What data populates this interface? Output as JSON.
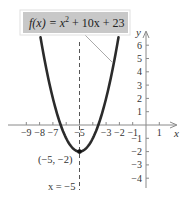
{
  "chart_data": {
    "type": "line",
    "title": "",
    "function_label": "f(x) = x² + 10x + 23",
    "function_label_parts": {
      "lhs": "f(x) = x",
      "exp": "2",
      "rhs": " + 10x + 23"
    },
    "xlabel": "x",
    "ylabel": "y",
    "xlim": [
      -10,
      2.5
    ],
    "ylim": [
      -5,
      6.5
    ],
    "x_ticks": [
      -9,
      -8,
      -7,
      -6,
      -5,
      -4,
      -3,
      -2,
      -1,
      1
    ],
    "x_tick_labels": [
      "−9",
      "−8",
      "−7",
      "−5",
      "−3",
      "−2",
      "−1",
      "1"
    ],
    "x_tick_label_values": [
      -9,
      -8,
      -7,
      -5,
      -3,
      -2,
      -1,
      1
    ],
    "y_ticks": [
      -4,
      -3,
      -2,
      -1,
      1,
      2,
      3,
      4,
      5,
      6
    ],
    "y_tick_labels": [
      "6",
      "5",
      "4",
      "3",
      "2",
      "1",
      "−1",
      "−2",
      "−3",
      "−4"
    ],
    "y_tick_label_values": [
      6,
      5,
      4,
      3,
      2,
      1,
      -1,
      -2,
      -3,
      -4
    ],
    "series": [
      {
        "name": "f(x) = x^2 + 10x + 23",
        "coefficients": {
          "a": 1,
          "b": 10,
          "c": 23
        },
        "x": [
          -7.9,
          -7.5,
          -7,
          -6.5,
          -6,
          -5.5,
          -5,
          -4.5,
          -4,
          -3.5,
          -3,
          -2.5,
          -2.1
        ],
        "values": [
          6.41,
          4.25,
          2,
          0.25,
          -1,
          -1.75,
          -2,
          -1.75,
          -1,
          0.25,
          2,
          4.25,
          6.41
        ]
      }
    ],
    "annotations": [
      {
        "type": "vertex",
        "label": "(−5, −2)",
        "x": -5,
        "y": -2
      },
      {
        "type": "axis_of_symmetry",
        "label": "x = −5",
        "x": -5,
        "style": "dashed"
      }
    ],
    "grid": false,
    "legend": "none"
  },
  "colors": {
    "curve": "#2b2b2b",
    "axis": "#8a8a8a",
    "label_box_fill": "#c8c8c8",
    "label_box_border": "#e0e0e0",
    "text": "#333333"
  }
}
